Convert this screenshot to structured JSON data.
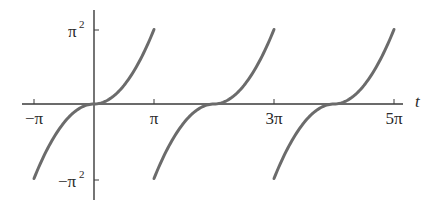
{
  "chart_data": {
    "type": "line",
    "title": "",
    "xlabel": "t",
    "ylabel": "",
    "function": "f(t) = t|t| on (-π, π], extended periodically with period 2π",
    "period": "2π",
    "xlim": [
      "-π",
      "5π"
    ],
    "ylim": [
      "-π²",
      "π²"
    ],
    "grid": false,
    "legend": null,
    "x_ticks": [
      {
        "value": -1,
        "label": "−π"
      },
      {
        "value": 1,
        "label": "π"
      },
      {
        "value": 3,
        "label": "3π"
      },
      {
        "value": 5,
        "label": "5π"
      }
    ],
    "y_ticks": [
      {
        "value": 1,
        "label": "π",
        "sup": "2"
      },
      {
        "value": -1,
        "label": "−π",
        "sup": "2"
      }
    ],
    "x_units": "π",
    "y_units": "π²",
    "series": [
      {
        "name": "branch-1",
        "t_range_pi": [
          -1,
          1
        ],
        "center_pi": 0,
        "y_range_pi2": [
          -1,
          1
        ]
      },
      {
        "name": "branch-2",
        "t_range_pi": [
          1,
          3
        ],
        "center_pi": 2,
        "y_range_pi2": [
          -1,
          1
        ]
      },
      {
        "name": "branch-3",
        "t_range_pi": [
          3,
          5
        ],
        "center_pi": 4,
        "y_range_pi2": [
          -1,
          1
        ]
      }
    ],
    "colors": {
      "curve": "#6b6b6b",
      "axis": "#3a3a3a"
    }
  },
  "labels": {
    "x_axis": "t",
    "tick_neg_pi": "−π",
    "tick_pi": "π",
    "tick_3pi": "3π",
    "tick_5pi": "5π",
    "tick_pi2_base": "π",
    "tick_pi2_sup": "2",
    "tick_negpi2_base": "−π",
    "tick_negpi2_sup": "2"
  }
}
